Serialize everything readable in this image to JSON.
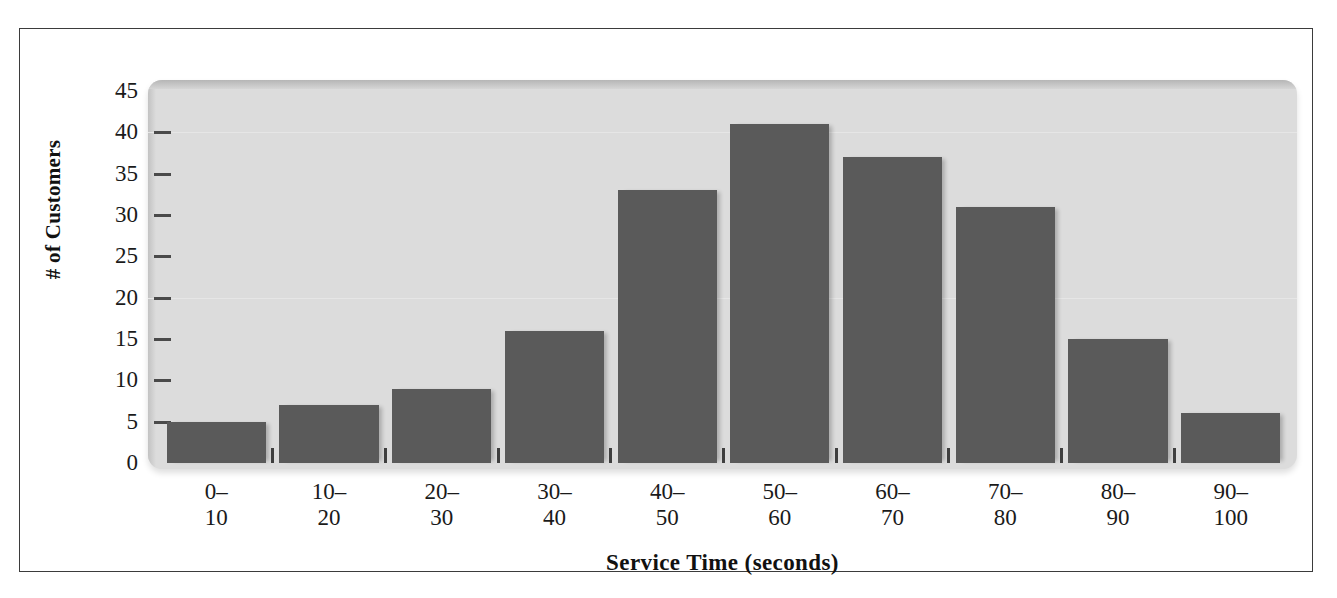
{
  "chart_data": {
    "type": "bar",
    "title": "",
    "xlabel": "Service Time (seconds)",
    "ylabel": "# of Customers",
    "categories": [
      "0–10",
      "10–20",
      "20–30",
      "30–40",
      "40–50",
      "50–60",
      "60–70",
      "70–80",
      "80–90",
      "90–100"
    ],
    "category_lines": [
      {
        "top": "0–",
        "bottom": "10"
      },
      {
        "top": "10–",
        "bottom": "20"
      },
      {
        "top": "20–",
        "bottom": "30"
      },
      {
        "top": "30–",
        "bottom": "40"
      },
      {
        "top": "40–",
        "bottom": "50"
      },
      {
        "top": "50–",
        "bottom": "60"
      },
      {
        "top": "60–",
        "bottom": "70"
      },
      {
        "top": "70–",
        "bottom": "80"
      },
      {
        "top": "80–",
        "bottom": "90"
      },
      {
        "top": "90–",
        "bottom": "100"
      }
    ],
    "values": [
      5,
      7,
      9,
      16,
      33,
      41,
      37,
      31,
      15,
      6
    ],
    "ylim": [
      0,
      45
    ],
    "ytick_values": [
      0,
      5,
      10,
      15,
      20,
      25,
      30,
      35,
      40,
      45
    ],
    "ytick_labels": [
      "0",
      "5",
      "10",
      "15",
      "20",
      "25",
      "30",
      "35",
      "40",
      "45"
    ],
    "grid": true,
    "legend": "none",
    "bar_color": "#5a5a5a",
    "panel_color": "#dcdcdc",
    "axis_text_color": "#1a1a1a"
  }
}
